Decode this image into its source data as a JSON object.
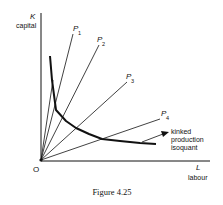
{
  "figure": {
    "caption": "Figure 4.25",
    "colors": {
      "ink": "#111111",
      "background": "#ffffff"
    }
  },
  "axes": {
    "y": {
      "symbol": "K",
      "label": "capital"
    },
    "x": {
      "symbol": "L",
      "label": "labour"
    },
    "origin_label": "O"
  },
  "rays": [
    {
      "name": "P",
      "sub": "1"
    },
    {
      "name": "P",
      "sub": "2"
    },
    {
      "name": "P",
      "sub": "3"
    },
    {
      "name": "P",
      "sub": "4"
    }
  ],
  "isoquant": {
    "label_lines": [
      "kinked",
      "production",
      "isoquant"
    ]
  }
}
